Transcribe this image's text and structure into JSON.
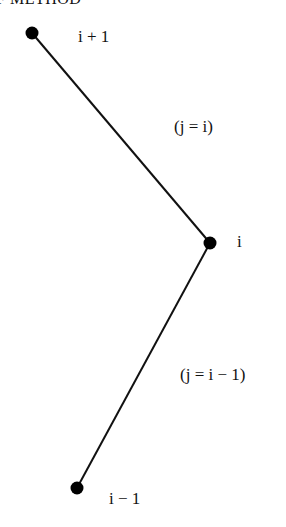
{
  "heading": "F METHOD",
  "nodes": [
    {
      "id": "top",
      "label": "i + 1",
      "x": 32,
      "y": 33
    },
    {
      "id": "mid",
      "label": "i",
      "x": 210,
      "y": 243
    },
    {
      "id": "bottom",
      "label": "i − 1",
      "x": 77,
      "y": 488
    }
  ],
  "edges": [
    {
      "from": "top",
      "to": "mid",
      "label": "(j = i)"
    },
    {
      "from": "mid",
      "to": "bottom",
      "label": "(j = i − 1)"
    }
  ],
  "colors": {
    "line": "#111111",
    "node": "#000000",
    "background": "#ffffff"
  }
}
